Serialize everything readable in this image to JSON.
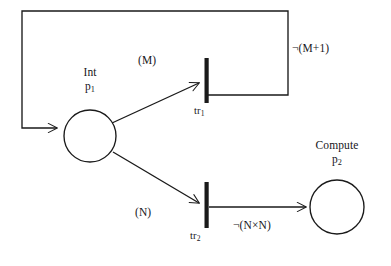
{
  "diagram": {
    "stroke_color": "#1a1a1a",
    "background_color": "#ffffff",
    "places": [
      {
        "id": "p1",
        "name": "Int",
        "label_id": "p",
        "label_sub": "1",
        "cx": 90,
        "cy": 136,
        "r": 26
      },
      {
        "id": "p2",
        "name": "Compute",
        "label_id": "p",
        "label_sub": "2",
        "cx": 337,
        "cy": 207,
        "r": 27
      }
    ],
    "transitions": [
      {
        "id": "tr1",
        "label_id": "tr",
        "label_sub": "1",
        "x": 206,
        "y_top": 58,
        "y_bottom": 103,
        "width": 4
      },
      {
        "id": "tr2",
        "label_id": "tr",
        "label_sub": "2",
        "x": 206,
        "y_top": 182,
        "y_bottom": 228,
        "width": 4
      }
    ],
    "arcs": [
      {
        "id": "p1-to-tr1",
        "from": "p1",
        "to": "tr1",
        "label": "(M)",
        "label_x": 138,
        "label_y": 54
      },
      {
        "id": "p1-to-tr2",
        "from": "p1",
        "to": "tr2",
        "label": "(N)",
        "label_x": 135,
        "label_y": 206
      },
      {
        "id": "tr1-feedback-to-p1",
        "from": "tr1",
        "to": "p1",
        "label": "¬(M+1)",
        "label_x": 292,
        "label_y": 42
      },
      {
        "id": "tr2-to-p2",
        "from": "tr2",
        "to": "p2",
        "label": "¬(N×N)",
        "label_x": 233,
        "label_y": 219
      }
    ]
  }
}
